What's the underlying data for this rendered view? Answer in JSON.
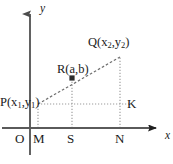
{
  "figure": {
    "kind": "coordinate-geometry-diagram",
    "background_color": "#ffffff",
    "ink_color": "#1a1a1a",
    "axis_color": "#5a5a5a",
    "guide_color": "#9a9a9a",
    "axes": {
      "x_label": "x",
      "y_label": "y",
      "origin_label": "O"
    },
    "points": [
      {
        "id": "P",
        "label": "P(x",
        "sub1": "1",
        "mid": ",y",
        "sub2": "1",
        "tail": ")",
        "x": 38,
        "y": 104
      },
      {
        "id": "R",
        "label": "R(a,b)",
        "x": 72,
        "y": 78
      },
      {
        "id": "Q",
        "label": "Q(x",
        "sub1": "2",
        "mid": ",y",
        "sub2": "2",
        "tail": ")",
        "x": 120,
        "y": 57
      },
      {
        "id": "K",
        "label": "K",
        "x": 120,
        "y": 104
      }
    ],
    "foot_labels": {
      "M": "M",
      "S": "S",
      "N": "N"
    },
    "label_P_parts": {
      "head": "P(x",
      "sub1": "1",
      "mid": ",y",
      "sub2": "1",
      "tail": ")"
    },
    "label_Q_parts": {
      "head": "Q(x",
      "sub1": "2",
      "mid": ",y",
      "sub2": "2",
      "tail": ")"
    },
    "label_R": "R(a,b)",
    "label_K": "K"
  }
}
